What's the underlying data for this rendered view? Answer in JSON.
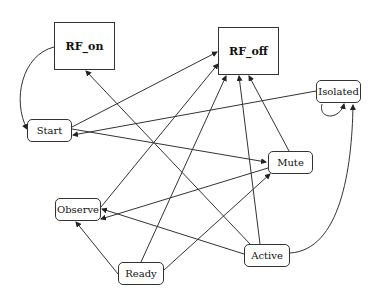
{
  "diagram": {
    "type": "state-transition",
    "nodes": [
      {
        "id": "RF_on",
        "label": "RF_on",
        "shape": "rect",
        "x": 54,
        "y": 22,
        "w": 61,
        "h": 48
      },
      {
        "id": "RF_off",
        "label": "RF_off",
        "shape": "rect",
        "x": 218,
        "y": 27,
        "w": 61,
        "h": 48
      },
      {
        "id": "Isolated",
        "label": "Isolated",
        "shape": "round",
        "x": 316,
        "y": 80,
        "w": 45,
        "h": 23
      },
      {
        "id": "Start",
        "label": "Start",
        "shape": "round",
        "x": 27,
        "y": 119,
        "w": 45,
        "h": 23
      },
      {
        "id": "Mute",
        "label": "Mute",
        "shape": "round",
        "x": 268,
        "y": 151,
        "w": 45,
        "h": 23
      },
      {
        "id": "Observe",
        "label": "Observe",
        "shape": "round",
        "x": 55,
        "y": 198,
        "w": 46,
        "h": 23
      },
      {
        "id": "Active",
        "label": "Active",
        "shape": "round",
        "x": 244,
        "y": 244,
        "w": 46,
        "h": 23
      },
      {
        "id": "Ready",
        "label": "Ready",
        "shape": "round",
        "x": 118,
        "y": 262,
        "w": 46,
        "h": 23
      }
    ],
    "edges": [
      {
        "from": "RF_on",
        "to": "Start",
        "curved": true
      },
      {
        "from": "Start",
        "to": "RF_off"
      },
      {
        "from": "Isolated",
        "to": "Start"
      },
      {
        "from": "Start",
        "to": "Mute"
      },
      {
        "from": "Active",
        "to": "RF_on"
      },
      {
        "from": "Observe",
        "to": "RF_off"
      },
      {
        "from": "Ready",
        "to": "RF_off"
      },
      {
        "from": "Active",
        "to": "RF_off"
      },
      {
        "from": "Mute",
        "to": "RF_off"
      },
      {
        "from": "Isolated",
        "to": "Isolated",
        "self_loop": true
      },
      {
        "from": "Active",
        "to": "Isolated",
        "curved": true
      },
      {
        "from": "Mute",
        "to": "Observe"
      },
      {
        "from": "Active",
        "to": "Observe"
      },
      {
        "from": "Ready",
        "to": "Observe"
      },
      {
        "from": "Ready",
        "to": "Mute"
      },
      {
        "from": "Start",
        "to": "Active"
      }
    ]
  }
}
